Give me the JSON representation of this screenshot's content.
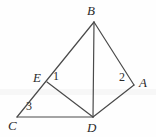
{
  "figure": {
    "width": 156,
    "height": 137,
    "background_color": "#fefefe",
    "stroke_color": "#4a4a4a",
    "stroke_width": 1.2,
    "label_color": "#2b2b2b"
  },
  "vertices": [
    {
      "id": "B",
      "label": "B",
      "x": 94,
      "y": 22,
      "label_x": 87,
      "label_y": 4
    },
    {
      "id": "E",
      "label": "E",
      "x": 47,
      "y": 82,
      "label_x": 33,
      "label_y": 71
    },
    {
      "id": "A",
      "label": "A",
      "x": 134,
      "y": 85,
      "label_x": 139,
      "label_y": 76
    },
    {
      "id": "C",
      "label": "C",
      "x": 17,
      "y": 117,
      "label_x": 8,
      "label_y": 119
    },
    {
      "id": "D",
      "label": "D",
      "x": 93,
      "y": 117,
      "label_x": 87,
      "label_y": 121
    }
  ],
  "segments": [
    {
      "id": "CB",
      "from": "C",
      "to": "B",
      "note": "straight line through E"
    },
    {
      "id": "BD",
      "from": "B",
      "to": "D",
      "note": "vertical cevian"
    },
    {
      "id": "BA",
      "from": "B",
      "to": "A",
      "note": "upper right side"
    },
    {
      "id": "AD",
      "from": "A",
      "to": "D",
      "note": "lower right side"
    },
    {
      "id": "ED",
      "from": "E",
      "to": "D",
      "note": "cevian from E"
    },
    {
      "id": "CD",
      "from": "C",
      "to": "D",
      "note": "base, horizontal"
    }
  ],
  "angle_labels": [
    {
      "id": "angle-1",
      "label": "1",
      "at_vertex": "E",
      "x": 53,
      "y": 70
    },
    {
      "id": "angle-2",
      "label": "2",
      "at_vertex": "A",
      "x": 119,
      "y": 71
    },
    {
      "id": "angle-3",
      "label": "3",
      "at_vertex": "C",
      "x": 26,
      "y": 100
    }
  ],
  "artifacts": {
    "scan_band_color": "#f7f7f7",
    "scan_band_y": 89,
    "scan_band_height": 6
  }
}
